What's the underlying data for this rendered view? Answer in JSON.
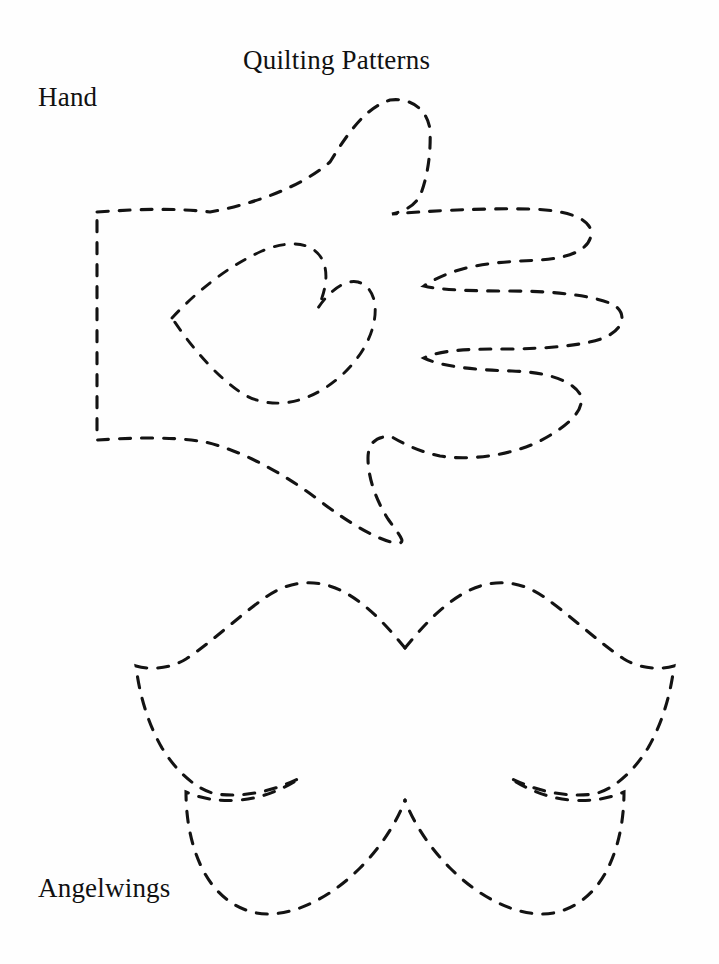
{
  "document": {
    "title": "Quilting Patterns",
    "background_color": "#fefefe",
    "ink_color": "#131313",
    "page_width": 719,
    "page_height": 964
  },
  "header": {
    "title": "Quilting Patterns"
  },
  "patterns": [
    {
      "name": "hand",
      "label": "Hand",
      "description": "Dashed outline of an open hand with a heart-shaped cutout in the palm",
      "line_style": "dashed",
      "stroke_color": "#131313"
    },
    {
      "name": "angelwings",
      "label": "Angelwings",
      "description": "Dashed outline of a pair of angel wings with scalloped lower edges",
      "line_style": "dashed",
      "stroke_color": "#131313"
    }
  ],
  "labels": {
    "hand": "Hand",
    "angelwings": "Angelwings"
  }
}
